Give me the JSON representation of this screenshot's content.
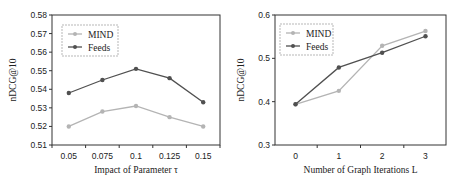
{
  "chart_data": [
    {
      "type": "line",
      "title": "",
      "xlabel": "Impact of Parameter τ",
      "ylabel": "nDCG@10",
      "categories": [
        "0.05",
        "0.075",
        "0.1",
        "0.125",
        "0.15"
      ],
      "yticks": [
        "0.51",
        "0.52",
        "0.53",
        "0.54",
        "0.55",
        "0.56",
        "0.57",
        "0.58"
      ],
      "ylim": [
        0.51,
        0.58
      ],
      "grid": false,
      "legend_position": "upper left",
      "series": [
        {
          "name": "MIND",
          "color": "#b4b4b4",
          "values": [
            0.52,
            0.528,
            0.531,
            0.525,
            0.52
          ]
        },
        {
          "name": "Feeds",
          "color": "#505050",
          "values": [
            0.538,
            0.545,
            0.551,
            0.546,
            0.533
          ]
        }
      ]
    },
    {
      "type": "line",
      "title": "",
      "xlabel": "Number of Graph Iterations L",
      "ylabel": "nDCG@10",
      "categories": [
        "0",
        "1",
        "2",
        "3"
      ],
      "yticks": [
        "0.3",
        "0.4",
        "0.5",
        "0.6"
      ],
      "ylim": [
        0.3,
        0.6
      ],
      "grid": false,
      "legend_position": "upper left",
      "series": [
        {
          "name": "MIND",
          "color": "#b4b4b4",
          "values": [
            0.394,
            0.425,
            0.529,
            0.563
          ]
        },
        {
          "name": "Feeds",
          "color": "#505050",
          "values": [
            0.394,
            0.479,
            0.513,
            0.551
          ]
        }
      ]
    }
  ]
}
